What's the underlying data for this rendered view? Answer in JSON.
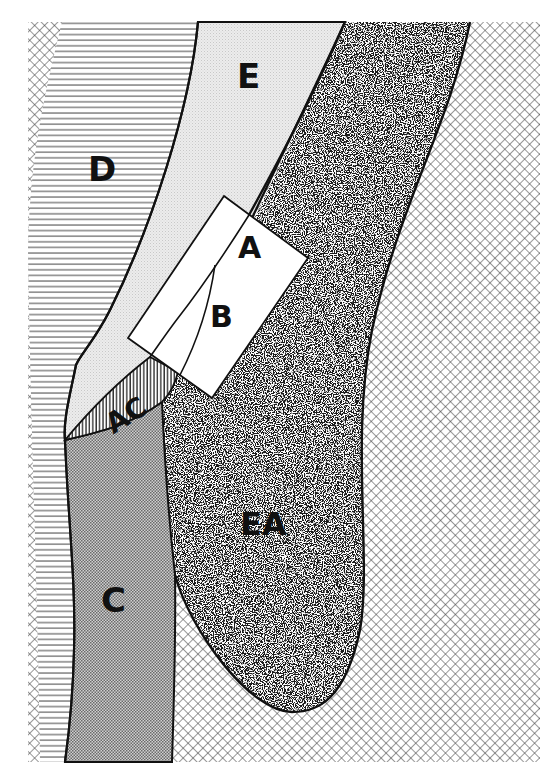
{
  "figure": {
    "type": "anatomical-schematic",
    "style": "black-and-white hatched regions",
    "colors": {
      "ink": "#111111",
      "paper": "#ffffff",
      "light_fill": "#e4e4e4",
      "stipple_dark": "#2a2a2a"
    }
  },
  "regions": [
    {
      "id": "D",
      "label": "D",
      "fill": "horizontal-lines"
    },
    {
      "id": "E",
      "label": "E",
      "fill": "light-dot-screen"
    },
    {
      "id": "EA",
      "label": "EA",
      "fill": "dense-random-stipple"
    },
    {
      "id": "C",
      "label": "C",
      "fill": "fine-checker-screen"
    },
    {
      "id": "AC",
      "label": "AC",
      "fill": "vertical-lines"
    },
    {
      "id": "background",
      "label": "",
      "fill": "diagonal-crosshatch"
    }
  ],
  "inset": {
    "description": "rotated rectangular box outlining region of interest",
    "labels": {
      "a": "A",
      "b": "B"
    }
  },
  "labels": {
    "d": "D",
    "e": "E",
    "a": "A",
    "b": "B",
    "ac": "AC",
    "ea": "EA",
    "c": "C"
  }
}
